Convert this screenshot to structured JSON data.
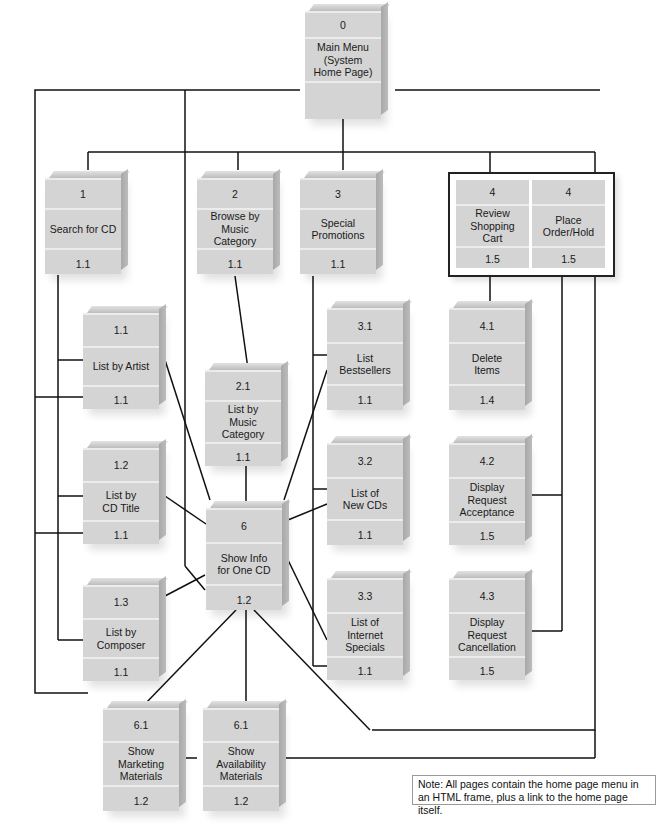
{
  "diagram": {
    "type": "site-map-hierarchy",
    "nodes": [
      {
        "id": "0",
        "number": "0",
        "title": "Main Menu (System Home Page)",
        "lines": [
          "Main Menu",
          "(System",
          "Home Page)"
        ],
        "footer": ""
      },
      {
        "id": "1",
        "number": "1",
        "title": "Search for CD",
        "lines": [
          "Search for CD"
        ],
        "footer": "1.1"
      },
      {
        "id": "2",
        "number": "2",
        "title": "Browse by Music Category",
        "lines": [
          "Browse by",
          "Music",
          "Category"
        ],
        "footer": "1.1"
      },
      {
        "id": "3",
        "number": "3",
        "title": "Special Promotions",
        "lines": [
          "Special",
          "Promotions"
        ],
        "footer": "1.1"
      },
      {
        "id": "4a",
        "number": "4",
        "title": "Review Shopping Cart",
        "lines": [
          "Review",
          "Shopping",
          "Cart"
        ],
        "footer": "1.5"
      },
      {
        "id": "4b",
        "number": "4",
        "title": "Place Order/Hold",
        "lines": [
          "Place",
          "Order/Hold"
        ],
        "footer": "1.5"
      },
      {
        "id": "1.1",
        "number": "1.1",
        "title": "List by Artist",
        "lines": [
          "List by Artist"
        ],
        "footer": "1.1"
      },
      {
        "id": "1.2",
        "number": "1.2",
        "title": "List by CD Title",
        "lines": [
          "List by",
          "CD Title"
        ],
        "footer": "1.1"
      },
      {
        "id": "1.3",
        "number": "1.3",
        "title": "List by Composer",
        "lines": [
          "List by",
          "Composer"
        ],
        "footer": "1.1"
      },
      {
        "id": "2.1",
        "number": "2.1",
        "title": "List by Music Category",
        "lines": [
          "List by",
          "Music",
          "Category"
        ],
        "footer": "1.1"
      },
      {
        "id": "3.1",
        "number": "3.1",
        "title": "List Bestsellers",
        "lines": [
          "List",
          "Bestsellers"
        ],
        "footer": "1.1"
      },
      {
        "id": "3.2",
        "number": "3.2",
        "title": "List of New CDs",
        "lines": [
          "List of",
          "New CDs"
        ],
        "footer": "1.1"
      },
      {
        "id": "3.3",
        "number": "3.3",
        "title": "List of Internet Specials",
        "lines": [
          "List of",
          "Internet",
          "Specials"
        ],
        "footer": "1.1"
      },
      {
        "id": "4.1",
        "number": "4.1",
        "title": "Delete Items",
        "lines": [
          "Delete",
          "Items"
        ],
        "footer": "1.4"
      },
      {
        "id": "4.2",
        "number": "4.2",
        "title": "Display Request Acceptance",
        "lines": [
          "Display",
          "Request",
          "Acceptance"
        ],
        "footer": "1.5"
      },
      {
        "id": "4.3",
        "number": "4.3",
        "title": "Display Request Cancellation",
        "lines": [
          "Display",
          "Request",
          "Cancellation"
        ],
        "footer": "1.5"
      },
      {
        "id": "6",
        "number": "6",
        "title": "Show Info for One CD",
        "lines": [
          "Show Info",
          "for One CD"
        ],
        "footer": "1.2"
      },
      {
        "id": "6.1a",
        "number": "6.1",
        "title": "Show Marketing Materials",
        "lines": [
          "Show",
          "Marketing",
          "Materials"
        ],
        "footer": "1.2"
      },
      {
        "id": "6.1b",
        "number": "6.1",
        "title": "Show Availability Materials",
        "lines": [
          "Show",
          "Availability",
          "Materials"
        ],
        "footer": "1.2"
      }
    ],
    "edges": [
      [
        "0",
        "1"
      ],
      [
        "0",
        "2"
      ],
      [
        "0",
        "3"
      ],
      [
        "0",
        "4a"
      ],
      [
        "0",
        "4b"
      ],
      [
        "1",
        "1.1"
      ],
      [
        "1",
        "1.2"
      ],
      [
        "1",
        "1.3"
      ],
      [
        "2",
        "2.1"
      ],
      [
        "3",
        "3.1"
      ],
      [
        "3",
        "3.2"
      ],
      [
        "3",
        "3.3"
      ],
      [
        "4a",
        "4.1"
      ],
      [
        "4b",
        "4.2"
      ],
      [
        "4b",
        "4.3"
      ],
      [
        "1.1",
        "6"
      ],
      [
        "1.2",
        "6"
      ],
      [
        "1.3",
        "6"
      ],
      [
        "2.1",
        "6"
      ],
      [
        "3.1",
        "6"
      ],
      [
        "3.2",
        "6"
      ],
      [
        "3.3",
        "6"
      ],
      [
        "6",
        "6.1a"
      ],
      [
        "6",
        "6.1b"
      ],
      [
        "6.1a",
        "6.1b"
      ],
      [
        "6",
        "6.1b-link"
      ]
    ],
    "note": "Note: All pages contain the home page menu in an HTML frame, plus a link to the home page itself.",
    "note_lines": [
      "Note: All pages contain the home page menu in",
      "an HTML frame, plus a link to the home page itself."
    ],
    "colors": {
      "box_face": "#d4d4d4",
      "box_divider": "#ececec",
      "line": "#111111",
      "background": "#ffffff"
    }
  }
}
